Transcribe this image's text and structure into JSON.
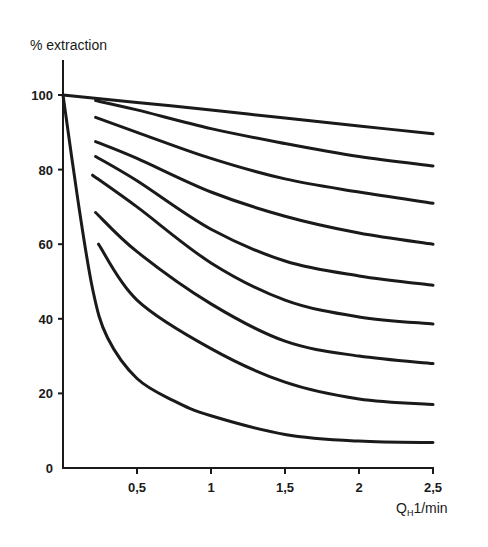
{
  "chart_data": {
    "type": "line",
    "title": "",
    "ylabel": "% extraction",
    "xlabel": {
      "main": "Q",
      "subscript": "H",
      "unit": "1/min"
    },
    "xlim": [
      0,
      2.5
    ],
    "ylim": [
      0,
      100
    ],
    "grid": false,
    "legend": "none",
    "xticks": [
      {
        "value": 0.5,
        "label": "0,5"
      },
      {
        "value": 1,
        "label": "1"
      },
      {
        "value": 1.5,
        "label": "1,5"
      },
      {
        "value": 2,
        "label": "2"
      },
      {
        "value": 2.5,
        "label": "2,5"
      }
    ],
    "yticks": [
      {
        "value": 0,
        "label": "0"
      },
      {
        "value": 20,
        "label": "20"
      },
      {
        "value": 40,
        "label": "40"
      },
      {
        "value": 60,
        "label": "60"
      },
      {
        "value": 80,
        "label": "80"
      },
      {
        "value": 100,
        "label": "100"
      }
    ],
    "series": [
      {
        "name": "curve-1",
        "points": [
          [
            0,
            100
          ],
          [
            0.5,
            98
          ],
          [
            1,
            96
          ],
          [
            1.5,
            93.8
          ],
          [
            2,
            91.7
          ],
          [
            2.5,
            89.6
          ]
        ]
      },
      {
        "name": "curve-2",
        "points": [
          [
            0.22,
            98.5
          ],
          [
            0.5,
            96
          ],
          [
            1,
            91
          ],
          [
            1.5,
            87
          ],
          [
            2,
            83.5
          ],
          [
            2.5,
            81
          ]
        ]
      },
      {
        "name": "curve-3",
        "points": [
          [
            0.22,
            94
          ],
          [
            0.5,
            90
          ],
          [
            1,
            83
          ],
          [
            1.5,
            77.5
          ],
          [
            2,
            74
          ],
          [
            2.5,
            71
          ]
        ]
      },
      {
        "name": "curve-4",
        "points": [
          [
            0.22,
            87.5
          ],
          [
            0.5,
            83
          ],
          [
            1,
            74
          ],
          [
            1.5,
            67.5
          ],
          [
            2,
            63
          ],
          [
            2.5,
            60
          ]
        ]
      },
      {
        "name": "curve-5",
        "points": [
          [
            0.22,
            83.5
          ],
          [
            0.5,
            77
          ],
          [
            1,
            64
          ],
          [
            1.5,
            55.5
          ],
          [
            2,
            51.5
          ],
          [
            2.5,
            49
          ]
        ]
      },
      {
        "name": "curve-6",
        "points": [
          [
            0.2,
            78.5
          ],
          [
            0.5,
            70
          ],
          [
            1,
            55
          ],
          [
            1.5,
            45
          ],
          [
            2,
            40.5
          ],
          [
            2.5,
            38.6
          ]
        ]
      },
      {
        "name": "curve-7",
        "points": [
          [
            0.22,
            68.5
          ],
          [
            0.5,
            58
          ],
          [
            1,
            44
          ],
          [
            1.5,
            34
          ],
          [
            2,
            30
          ],
          [
            2.5,
            28
          ]
        ]
      },
      {
        "name": "curve-8",
        "points": [
          [
            0.24,
            60
          ],
          [
            0.5,
            45
          ],
          [
            1,
            32
          ],
          [
            1.5,
            23
          ],
          [
            2,
            18.5
          ],
          [
            2.5,
            17
          ]
        ]
      },
      {
        "name": "curve-9",
        "points": [
          [
            0,
            100
          ],
          [
            0.1,
            72
          ],
          [
            0.2,
            48
          ],
          [
            0.3,
            35
          ],
          [
            0.5,
            24
          ],
          [
            0.75,
            18
          ],
          [
            1,
            14
          ],
          [
            1.5,
            9
          ],
          [
            2,
            7.2
          ],
          [
            2.5,
            6.8
          ]
        ]
      }
    ]
  }
}
